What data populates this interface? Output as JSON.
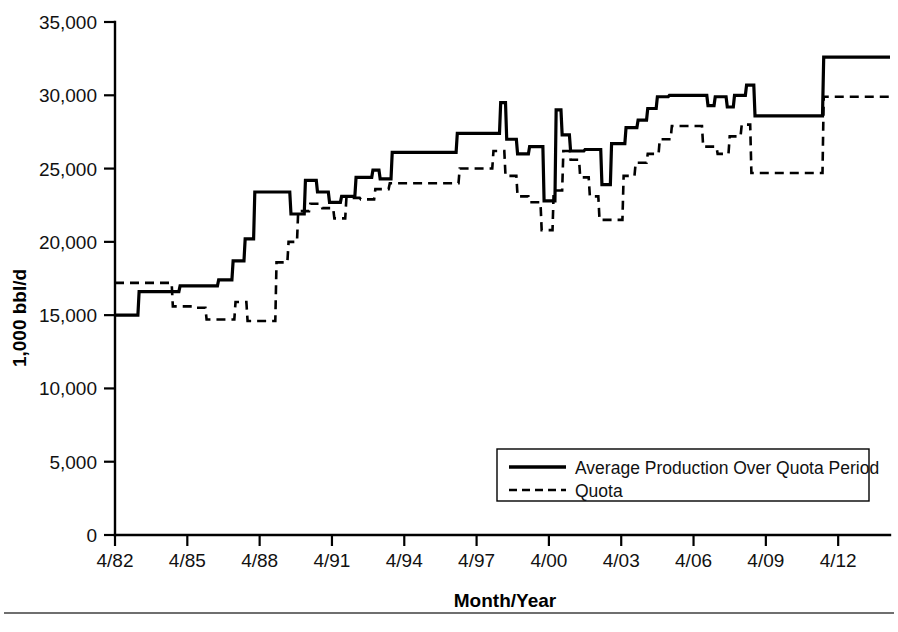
{
  "chart_data": {
    "type": "line",
    "title": "",
    "subtitle": "",
    "xlabel": "Month/Year",
    "ylabel": "1,000 bbl/d",
    "xlim": [
      1982.25,
      1984.0
    ],
    "ylim": [
      0,
      35000
    ],
    "grid": false,
    "legend_position": "inside-lower-right",
    "x_tick_labels": [
      "4/82",
      "4/85",
      "4/88",
      "4/91",
      "4/94",
      "4/97",
      "4/00",
      "4/03",
      "4/06",
      "4/09",
      "4/12"
    ],
    "x_tick_values": [
      1982.25,
      1985.25,
      1988.25,
      1991.25,
      1994.25,
      1997.25,
      2000.25,
      2003.25,
      2006.25,
      2009.25,
      2012.25
    ],
    "y_tick_labels": [
      "0",
      "5,000",
      "10,000",
      "15,000",
      "20,000",
      "25,000",
      "30,000",
      "35,000"
    ],
    "y_tick_values": [
      0,
      5000,
      10000,
      15000,
      20000,
      25000,
      30000,
      35000
    ],
    "x_axis_start": 1982.25,
    "x_axis_end": 2014.4,
    "series": [
      {
        "name": "Average Production Over Quota Period",
        "style": "solid",
        "step": "post",
        "points": [
          [
            1982.25,
            15000
          ],
          [
            1983.2,
            15000
          ],
          [
            1983.25,
            16600
          ],
          [
            1984.9,
            16600
          ],
          [
            1984.95,
            17000
          ],
          [
            1986.5,
            17000
          ],
          [
            1986.55,
            17400
          ],
          [
            1987.1,
            17400
          ],
          [
            1987.15,
            18700
          ],
          [
            1987.6,
            18700
          ],
          [
            1987.65,
            20200
          ],
          [
            1988.0,
            20200
          ],
          [
            1988.05,
            23400
          ],
          [
            1989.5,
            23400
          ],
          [
            1989.55,
            21900
          ],
          [
            1990.1,
            21900
          ],
          [
            1990.15,
            24200
          ],
          [
            1990.6,
            24200
          ],
          [
            1990.65,
            23400
          ],
          [
            1991.1,
            23400
          ],
          [
            1991.15,
            22700
          ],
          [
            1991.6,
            22700
          ],
          [
            1991.65,
            23100
          ],
          [
            1992.2,
            23100
          ],
          [
            1992.25,
            24400
          ],
          [
            1992.9,
            24400
          ],
          [
            1992.95,
            24900
          ],
          [
            1993.2,
            24900
          ],
          [
            1993.25,
            24300
          ],
          [
            1993.7,
            24300
          ],
          [
            1993.75,
            26100
          ],
          [
            1996.4,
            26100
          ],
          [
            1996.45,
            27400
          ],
          [
            1998.2,
            27400
          ],
          [
            1998.25,
            29500
          ],
          [
            1998.45,
            29500
          ],
          [
            1998.5,
            27000
          ],
          [
            1998.9,
            27000
          ],
          [
            1998.95,
            26000
          ],
          [
            1999.4,
            26000
          ],
          [
            1999.45,
            26500
          ],
          [
            2000.0,
            26500
          ],
          [
            2000.05,
            22800
          ],
          [
            2000.5,
            22800
          ],
          [
            2000.55,
            29000
          ],
          [
            2000.75,
            29000
          ],
          [
            2000.8,
            27300
          ],
          [
            2001.1,
            27300
          ],
          [
            2001.15,
            26200
          ],
          [
            2001.7,
            26200
          ],
          [
            2001.75,
            26300
          ],
          [
            2002.4,
            26300
          ],
          [
            2002.45,
            23900
          ],
          [
            2002.8,
            23900
          ],
          [
            2002.85,
            26700
          ],
          [
            2003.4,
            26700
          ],
          [
            2003.45,
            27800
          ],
          [
            2003.9,
            27800
          ],
          [
            2003.95,
            28300
          ],
          [
            2004.3,
            28300
          ],
          [
            2004.35,
            29100
          ],
          [
            2004.7,
            29100
          ],
          [
            2004.75,
            29900
          ],
          [
            2005.2,
            29900
          ],
          [
            2005.25,
            30000
          ],
          [
            2006.8,
            30000
          ],
          [
            2006.85,
            29300
          ],
          [
            2007.1,
            29300
          ],
          [
            2007.15,
            29900
          ],
          [
            2007.6,
            29900
          ],
          [
            2007.65,
            29200
          ],
          [
            2007.9,
            29200
          ],
          [
            2007.95,
            30000
          ],
          [
            2008.4,
            30000
          ],
          [
            2008.45,
            30700
          ],
          [
            2008.75,
            30700
          ],
          [
            2008.8,
            28600
          ],
          [
            2011.6,
            28600
          ],
          [
            2011.65,
            32600
          ],
          [
            2014.4,
            32600
          ]
        ]
      },
      {
        "name": "Quota",
        "style": "dashed",
        "step": "post",
        "points": [
          [
            1982.25,
            17200
          ],
          [
            1984.6,
            17200
          ],
          [
            1984.65,
            15600
          ],
          [
            1985.6,
            15600
          ],
          [
            1985.65,
            15500
          ],
          [
            1986.0,
            15500
          ],
          [
            1986.05,
            14700
          ],
          [
            1987.2,
            14700
          ],
          [
            1987.25,
            15900
          ],
          [
            1987.7,
            15900
          ],
          [
            1987.75,
            14600
          ],
          [
            1988.9,
            14600
          ],
          [
            1988.95,
            18600
          ],
          [
            1989.4,
            18600
          ],
          [
            1989.45,
            20000
          ],
          [
            1989.8,
            20000
          ],
          [
            1989.85,
            22100
          ],
          [
            1990.3,
            22100
          ],
          [
            1990.35,
            22600
          ],
          [
            1990.8,
            22600
          ],
          [
            1990.85,
            22300
          ],
          [
            1991.3,
            22300
          ],
          [
            1991.35,
            21600
          ],
          [
            1991.8,
            21600
          ],
          [
            1991.85,
            23000
          ],
          [
            1992.4,
            23000
          ],
          [
            1992.45,
            22900
          ],
          [
            1993.0,
            22900
          ],
          [
            1993.05,
            23600
          ],
          [
            1993.6,
            23600
          ],
          [
            1993.65,
            24000
          ],
          [
            1996.5,
            24000
          ],
          [
            1996.55,
            25000
          ],
          [
            1997.9,
            25000
          ],
          [
            1997.95,
            26200
          ],
          [
            1998.4,
            26200
          ],
          [
            1998.45,
            24500
          ],
          [
            1998.9,
            24500
          ],
          [
            1998.95,
            23100
          ],
          [
            1999.4,
            23100
          ],
          [
            1999.45,
            22700
          ],
          [
            1999.9,
            22700
          ],
          [
            1999.95,
            20800
          ],
          [
            2000.4,
            20800
          ],
          [
            2000.45,
            23500
          ],
          [
            2000.8,
            23500
          ],
          [
            2000.85,
            26200
          ],
          [
            2001.1,
            26200
          ],
          [
            2001.15,
            25600
          ],
          [
            2001.5,
            25600
          ],
          [
            2001.55,
            24400
          ],
          [
            2001.9,
            24400
          ],
          [
            2001.95,
            23100
          ],
          [
            2002.3,
            23100
          ],
          [
            2002.35,
            21500
          ],
          [
            2003.3,
            21500
          ],
          [
            2003.35,
            24500
          ],
          [
            2003.8,
            24500
          ],
          [
            2003.85,
            25400
          ],
          [
            2004.3,
            25400
          ],
          [
            2004.35,
            26000
          ],
          [
            2004.8,
            26000
          ],
          [
            2004.85,
            27000
          ],
          [
            2005.3,
            27000
          ],
          [
            2005.35,
            27900
          ],
          [
            2006.6,
            27900
          ],
          [
            2006.65,
            26500
          ],
          [
            2007.2,
            26500
          ],
          [
            2007.25,
            26000
          ],
          [
            2007.7,
            26000
          ],
          [
            2007.75,
            27200
          ],
          [
            2008.2,
            27200
          ],
          [
            2008.25,
            28000
          ],
          [
            2008.6,
            28000
          ],
          [
            2008.65,
            24700
          ],
          [
            2011.6,
            24700
          ],
          [
            2011.65,
            29900
          ],
          [
            2014.4,
            29900
          ]
        ]
      }
    ],
    "legend": [
      {
        "label": "Average Production Over Quota Period",
        "style": "solid"
      },
      {
        "label": "Quota",
        "style": "dashed"
      }
    ]
  }
}
